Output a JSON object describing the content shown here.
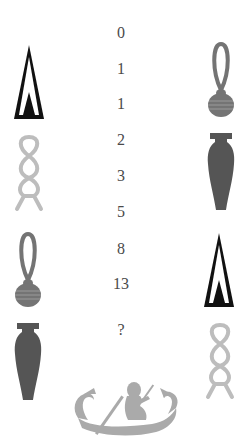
{
  "puzzle": {
    "sequence": [
      "0",
      "1",
      "1",
      "2",
      "3",
      "5",
      "8",
      "13",
      "?"
    ],
    "sequence_y": [
      33,
      69,
      104,
      140,
      176,
      212,
      249,
      284,
      330
    ]
  },
  "left_column": {
    "icons": [
      {
        "name": "cone-icon",
        "color": "#111111"
      },
      {
        "name": "rope-icon",
        "color": "#bdbdbd"
      },
      {
        "name": "knot-icon",
        "color": "#747474"
      },
      {
        "name": "vase-icon",
        "color": "#555555"
      }
    ]
  },
  "right_column": {
    "icons": [
      {
        "name": "knot-icon",
        "color": "#747474"
      },
      {
        "name": "vase-icon",
        "color": "#555555"
      },
      {
        "name": "cone-icon",
        "color": "#111111"
      },
      {
        "name": "rope-icon",
        "color": "#bdbdbd"
      }
    ]
  },
  "footer": {
    "image": {
      "name": "boat-icon",
      "color": "#aaaaaa"
    }
  }
}
